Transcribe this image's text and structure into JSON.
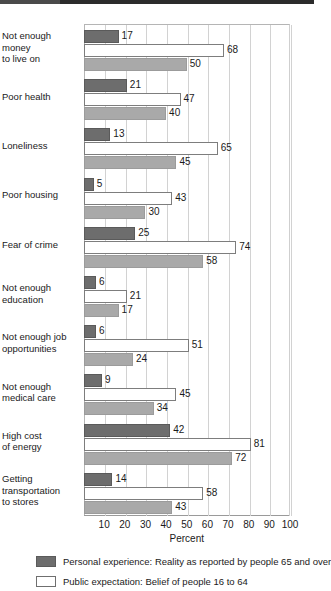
{
  "chart_data": {
    "type": "bar",
    "orientation": "horizontal",
    "title": "",
    "xlabel": "Percent",
    "ylabel": "",
    "xlim": [
      0,
      100
    ],
    "xticks": [
      10,
      20,
      30,
      40,
      50,
      60,
      70,
      80,
      90,
      100
    ],
    "grid": true,
    "legend_position": "bottom",
    "categories": [
      "Not enough\nmoney\nto live on",
      "Poor health",
      "Loneliness",
      "Poor housing",
      "Fear of crime",
      "Not enough\neducation",
      "Not enough job\nopportunities",
      "Not enough\nmedical care",
      "High cost\nof energy",
      "Getting\ntransportation\nto stores"
    ],
    "series": [
      {
        "name": "Personal experience: Reality as reported by people 65 and over",
        "style": "dark",
        "color": "#6d6d6d",
        "values": [
          17,
          21,
          13,
          5,
          25,
          6,
          6,
          9,
          42,
          14
        ]
      },
      {
        "name": "Public expectation: Belief of people 16 to 64",
        "style": "white",
        "color": "#ffffff",
        "values": [
          68,
          47,
          65,
          43,
          74,
          21,
          51,
          45,
          81,
          58
        ]
      },
      {
        "name": "",
        "style": "gray",
        "color": "#a9a9a9",
        "values": [
          50,
          40,
          45,
          30,
          58,
          17,
          24,
          34,
          72,
          43
        ]
      }
    ]
  },
  "categories_display": [
    {
      "lines": [
        "Not enough",
        "money",
        "to live on"
      ]
    },
    {
      "lines": [
        "Poor health"
      ]
    },
    {
      "lines": [
        "Loneliness"
      ]
    },
    {
      "lines": [
        "Poor housing"
      ]
    },
    {
      "lines": [
        "Fear of crime"
      ]
    },
    {
      "lines": [
        "Not enough",
        "education"
      ]
    },
    {
      "lines": [
        "Not enough job",
        "opportunities"
      ]
    },
    {
      "lines": [
        "Not enough",
        "medical care"
      ]
    },
    {
      "lines": [
        "High cost",
        "of energy"
      ]
    },
    {
      "lines": [
        "Getting",
        "transportation",
        "to stores"
      ]
    }
  ],
  "axis": {
    "xlabel": "Percent",
    "ticks": [
      "10",
      "20",
      "30",
      "40",
      "50",
      "60",
      "70",
      "80",
      "90",
      "100"
    ]
  },
  "legend": {
    "items": [
      {
        "swatch": "dark",
        "label": "Personal experience: Reality as reported by people 65 and over"
      },
      {
        "swatch": "white",
        "label": "Public expectation: Belief of people 16 to 64"
      }
    ]
  },
  "colors": {
    "dark_bar": "#6d6d6d",
    "white_bar": "#ffffff",
    "gray_bar": "#a9a9a9",
    "gridline": "#d2d2d2",
    "text": "#1a1a1a"
  }
}
